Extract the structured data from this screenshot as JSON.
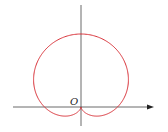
{
  "diagram": {
    "type": "polar-curve",
    "curve": "cardioid",
    "origin_label": "O",
    "colors": {
      "curve": "#d9333a",
      "axes": "#444444"
    },
    "geometry": {
      "cx": 81,
      "cy": 107,
      "a": 36.5
    }
  }
}
